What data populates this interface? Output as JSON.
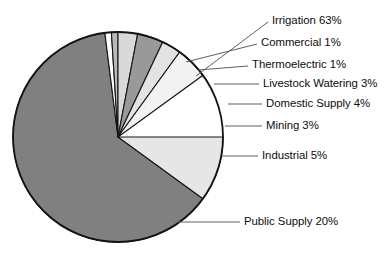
{
  "chart_data": {
    "type": "pie",
    "title": "",
    "subtitle": "",
    "xlabel": "",
    "ylabel": "",
    "legend_position": "callout-labels-right",
    "grid": false,
    "units": "percent",
    "total": 100,
    "categories": [
      "Irrigation",
      "Commercial",
      "Thermoelectric",
      "Livestock Watering",
      "Domestic Supply",
      "Mining",
      "Industrial",
      "Public Supply"
    ],
    "values": [
      63,
      1,
      1,
      3,
      4,
      3,
      5,
      20
    ],
    "slices": [
      {
        "name": "Irrigation",
        "value": 63,
        "label": "Irrigation 63%",
        "color": "#808080",
        "start_deg": 97.2,
        "end_deg": 324.0
      },
      {
        "name": "Commercial",
        "value": 1,
        "label": "Commercial 1%",
        "color": "#ffffff",
        "start_deg": 93.6,
        "end_deg": 97.2
      },
      {
        "name": "Thermoelectric",
        "value": 1,
        "label": "Thermoelectric 1%",
        "color": "#b9b9b9",
        "start_deg": 90.0,
        "end_deg": 93.6
      },
      {
        "name": "Livestock Watering",
        "value": 3,
        "label": "Livestock Watering 3%",
        "color": "#d9d9d9",
        "start_deg": 79.2,
        "end_deg": 90.0
      },
      {
        "name": "Domestic Supply",
        "value": 4,
        "label": "Domestic Supply 4%",
        "color": "#999999",
        "start_deg": 64.8,
        "end_deg": 79.2
      },
      {
        "name": "Mining",
        "value": 3,
        "label": "Mining 3%",
        "color": "#e3e3e3",
        "start_deg": 54.0,
        "end_deg": 64.8
      },
      {
        "name": "Industrial",
        "value": 5,
        "label": "Industrial 5%",
        "color": "#f2f2f2",
        "start_deg": 36.0,
        "end_deg": 54.0
      },
      {
        "name": "Public Supply",
        "value": 20,
        "label": "Public Supply 20%",
        "color": "#e6e6e6",
        "start_deg": 324.0,
        "end_deg": 360.0
      }
    ]
  },
  "geometry": {
    "center_x": 118,
    "center_y": 137,
    "radius": 105
  },
  "labels": {
    "irrigation": "Irrigation 63%",
    "commercial": "Commercial 1%",
    "thermoelectric": "Thermoelectric 1%",
    "livestock": "Livestock Watering 3%",
    "domestic": "Domestic Supply 4%",
    "mining": "Mining 3%",
    "industrial": "Industrial 5%",
    "public": "Public Supply 20%"
  }
}
